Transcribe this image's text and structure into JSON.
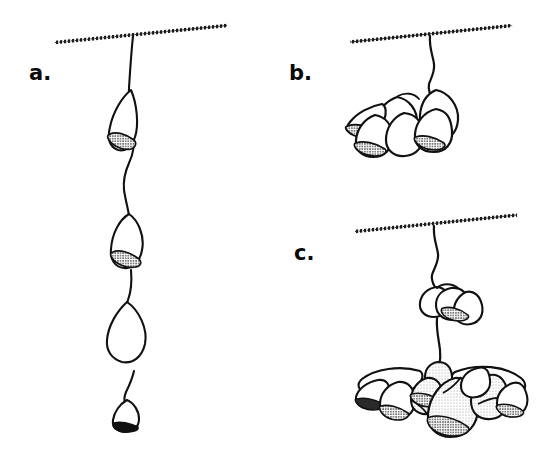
{
  "figure": {
    "type": "scientific-line-drawing",
    "background_color": "#ffffff",
    "ink_color": "#111111",
    "width": 537,
    "height": 466,
    "panels": [
      {
        "id": "a",
        "label": "a.",
        "label_position": {
          "x": 29,
          "y": 63
        },
        "description": "solitary individuals arranged in a linear chain along a single vertical stolon hanging from a substrate line",
        "substrate": {
          "x1": 55,
          "y1": 42,
          "x2": 227,
          "y2": 25,
          "texture": "stippled"
        },
        "attachment_x": 133,
        "zooid_count": 4,
        "zooids": [
          {
            "index": 1,
            "center": {
              "x": 127,
              "y": 121
            },
            "size": "medium",
            "shading": "outline-with-dark-stipple-base"
          },
          {
            "index": 2,
            "center": {
              "x": 131,
              "y": 240
            },
            "size": "large",
            "shading": "outline-with-dark-stipple-base"
          },
          {
            "index": 3,
            "center": {
              "x": 130,
              "y": 330
            },
            "size": "large",
            "shading": "outline-only"
          },
          {
            "index": 4,
            "center": {
              "x": 133,
              "y": 412
            },
            "size": "small",
            "shading": "solid-dark-base"
          }
        ]
      },
      {
        "id": "b",
        "label": "b.",
        "label_position": {
          "x": 289,
          "y": 63
        },
        "description": "small compact cluster of zooids aggregated at the end of a short stalk",
        "substrate": {
          "x1": 350,
          "y1": 42,
          "x2": 512,
          "y2": 25,
          "texture": "stippled"
        },
        "attachment_x": 430,
        "zooid_count": 7,
        "cluster_center": {
          "x": 390,
          "y": 120
        },
        "shading": "outline-with-stippled-apertures"
      },
      {
        "id": "c",
        "label": "c.",
        "label_position": {
          "x": 294,
          "y": 243
        },
        "description": "two-tier colony: a small upper cluster on the stalk and a large spreading lower colony of many stippled zooids",
        "substrate": {
          "x1": 355,
          "y1": 232,
          "x2": 517,
          "y2": 215,
          "texture": "stippled"
        },
        "attachment_x": 434,
        "upper_cluster": {
          "center": {
            "x": 440,
            "y": 305
          },
          "zooid_count": 4
        },
        "lower_colony": {
          "center": {
            "x": 440,
            "y": 390
          },
          "zooid_count": 12
        },
        "shading": "light-stipple-fill-with-dark-stipple-apertures"
      }
    ],
    "legend": {
      "stipple_light": "#d8d8d8",
      "stipple_dark": "#8e8e8e",
      "solid_dark": "#111111"
    }
  }
}
